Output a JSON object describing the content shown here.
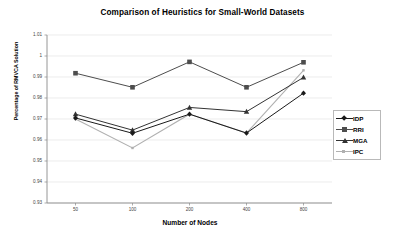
{
  "chart_data": {
    "type": "line",
    "title": "Comparison of Heuristics for Small-World Datasets",
    "xlabel": "Number of Nodes",
    "ylabel": "Percentage of RMVCA Solution",
    "categories": [
      "50",
      "100",
      "200",
      "400",
      "800"
    ],
    "ylim": [
      0.93,
      1.01
    ],
    "yticks": [
      "1.01",
      "1",
      "0.99",
      "0.98",
      "0.97",
      "0.96",
      "0.95",
      "0.94",
      "0.93"
    ],
    "ytick_values": [
      1.01,
      1.0,
      0.99,
      0.98,
      0.97,
      0.96,
      0.95,
      0.94,
      0.93
    ],
    "grid": true,
    "legend_position": "right",
    "series": [
      {
        "name": "IDP",
        "marker": "diamond",
        "color": "#1a1a1a",
        "values": [
          0.9705,
          0.9632,
          0.9723,
          0.9633,
          0.9823
        ]
      },
      {
        "name": "RRI",
        "marker": "square",
        "color": "#4d4d4d",
        "values": [
          0.9918,
          0.9851,
          0.9972,
          0.9851,
          0.997
        ]
      },
      {
        "name": "MGA",
        "marker": "triangle",
        "color": "#333333",
        "values": [
          0.9723,
          0.9647,
          0.9755,
          0.9735,
          0.9898
        ]
      },
      {
        "name": "IPC",
        "marker": "line",
        "color": "#b0b0b0",
        "values": [
          0.97,
          0.9562,
          0.9723,
          0.9633,
          0.9932
        ]
      }
    ]
  },
  "legend": {
    "items": [
      {
        "label": "IDP"
      },
      {
        "label": "RRI"
      },
      {
        "label": "MGA"
      },
      {
        "label": "IPC"
      }
    ]
  }
}
